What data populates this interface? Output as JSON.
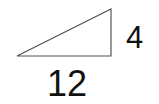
{
  "diagram": {
    "type": "right-triangle",
    "stroke_color": "#555555",
    "text_color": "#111111",
    "vertices": {
      "left": [
        17,
        56
      ],
      "top_right": [
        111,
        9
      ],
      "bottom_right": [
        111,
        56
      ]
    },
    "labels": {
      "vertical_leg": "4",
      "horizontal_leg": "12"
    }
  }
}
